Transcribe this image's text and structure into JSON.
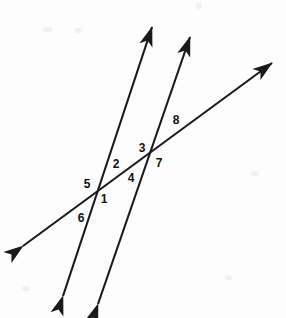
{
  "figure": {
    "width": 286,
    "height": 318,
    "background_color": "#fdfdfd",
    "stroke_color": "#1a1a1a",
    "stroke_width": 2.1
  },
  "chart_data": {
    "type": "diagram",
    "lines": [
      {
        "name": "parallel-line-left",
        "role": "parallel",
        "x1": 63,
        "y1": 296,
        "x2": 152,
        "y2": 27,
        "arrow_start": true,
        "arrow_end": true
      },
      {
        "name": "parallel-line-right",
        "role": "parallel",
        "x1": 98,
        "y1": 304,
        "x2": 190,
        "y2": 37,
        "arrow_start": true,
        "arrow_end": true
      },
      {
        "name": "transversal-line",
        "role": "transversal",
        "x1": 23,
        "y1": 246,
        "x2": 272,
        "y2": 63,
        "arrow_start": true,
        "arrow_end": true
      }
    ],
    "intersections": [
      {
        "name": "intersection-left",
        "x": 97,
        "y": 190
      },
      {
        "name": "intersection-right",
        "x": 153,
        "y": 155
      }
    ],
    "labels": [
      {
        "id": "angle-1",
        "text": "1",
        "x": 104,
        "y": 199
      },
      {
        "id": "angle-2",
        "text": "2",
        "x": 116,
        "y": 164
      },
      {
        "id": "angle-3",
        "text": "3",
        "x": 142,
        "y": 148
      },
      {
        "id": "angle-4",
        "text": "4",
        "x": 131,
        "y": 178
      },
      {
        "id": "angle-5",
        "text": "5",
        "x": 87,
        "y": 184
      },
      {
        "id": "angle-6",
        "text": "6",
        "x": 81,
        "y": 218
      },
      {
        "id": "angle-7",
        "text": "7",
        "x": 159,
        "y": 163
      },
      {
        "id": "angle-8",
        "text": "8",
        "x": 176,
        "y": 120
      }
    ]
  }
}
